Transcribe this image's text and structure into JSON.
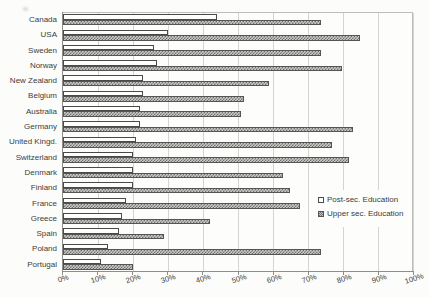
{
  "chart_data": {
    "type": "bar",
    "orientation": "horizontal",
    "title": "",
    "categories": [
      "Canada",
      "USA",
      "Sweden",
      "Norway",
      "New Zealand",
      "Belgium",
      "Australia",
      "Germany",
      "United Kingd.",
      "Switzerland",
      "Denmark",
      "Finland",
      "France",
      "Greece",
      "Spain",
      "Poland",
      "Portugal"
    ],
    "series": [
      {
        "name": "Post-sec. Education",
        "style": "white-fill",
        "values": [
          44,
          30,
          26,
          27,
          23,
          23,
          22,
          22,
          21,
          20,
          20,
          20,
          18,
          17,
          16,
          13,
          11
        ]
      },
      {
        "name": "Upper sec. Education",
        "style": "gray-hatched",
        "values": [
          74,
          85,
          74,
          80,
          59,
          52,
          51,
          83,
          77,
          82,
          63,
          65,
          68,
          42,
          29,
          74,
          20
        ]
      }
    ],
    "x_axis": {
      "min": 0,
      "max": 100,
      "tick_step": 10,
      "tick_labels": [
        "0%",
        "10%",
        "20%",
        "30%",
        "40%",
        "50%",
        "60%",
        "70%",
        "80%",
        "90%",
        "100%"
      ],
      "labels_rotated": true
    },
    "grid": "vertical-gridlines",
    "legend": {
      "position": "middle-right",
      "entries": [
        "Post-sec. Education",
        "Upper sec. Education"
      ]
    },
    "colors": {
      "post_sec_fill": "#ffffff",
      "upper_sec_fill": "#9a9a97",
      "bar_border": "#4a4a48",
      "gridline": "#d4d4d0",
      "axis": "#8d8d8a",
      "background": "#fcfcfa",
      "text": "#3c3c3a"
    }
  }
}
